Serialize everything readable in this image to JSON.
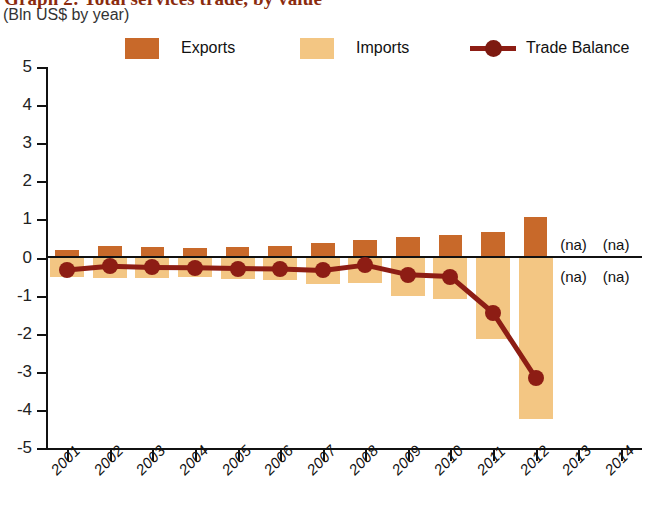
{
  "header": {
    "title": "Graph 2: Total services trade, by value",
    "subtitle": "(Bln US$ by year)"
  },
  "legend": [
    {
      "key": "exports",
      "label": "Exports",
      "color": "#c8692a",
      "marker": "square"
    },
    {
      "key": "imports",
      "label": "Imports",
      "color": "#f3c683",
      "marker": "square"
    },
    {
      "key": "trade_balance",
      "label": "Trade Balance",
      "color": "#8d1d14",
      "marker": "line-dot"
    }
  ],
  "annotations": [
    {
      "text": "(na)",
      "year": "2013",
      "position": "above-zero"
    },
    {
      "text": "(na)",
      "year": "2014",
      "position": "above-zero"
    },
    {
      "text": "(na)",
      "year": "2013",
      "position": "below-zero"
    },
    {
      "text": "(na)",
      "year": "2014",
      "position": "below-zero"
    }
  ],
  "chart_data": {
    "type": "bar",
    "title": "Graph 2: Total services trade, by value",
    "subtitle": "(Bln US$ by year)",
    "xlabel": "",
    "ylabel": "",
    "ylim": [
      -5,
      5
    ],
    "ytick_labels": [
      "5",
      "4",
      "3",
      "2",
      "1",
      "0",
      "-1",
      "-2",
      "-3",
      "-4",
      "-5"
    ],
    "yticks": [
      5,
      4,
      3,
      2,
      1,
      0,
      -1,
      -2,
      -3,
      -4,
      -5
    ],
    "grid": false,
    "legend_position": "top",
    "categories": [
      "2001",
      "2002",
      "2003",
      "2004",
      "2005",
      "2006",
      "2007",
      "2008",
      "2009",
      "2010",
      "2011",
      "2012",
      "2013",
      "2014"
    ],
    "series": [
      {
        "name": "Exports",
        "type": "bar",
        "color": "#c8692a",
        "values": [
          0.2,
          0.3,
          0.27,
          0.24,
          0.27,
          0.31,
          0.38,
          0.47,
          0.55,
          0.6,
          0.68,
          1.07,
          null,
          null
        ]
      },
      {
        "name": "Imports",
        "type": "bar",
        "color": "#f3c683",
        "values": [
          -0.52,
          -0.53,
          -0.54,
          -0.52,
          -0.56,
          -0.6,
          -0.7,
          -0.68,
          -1.0,
          -1.1,
          -2.15,
          -4.23,
          null,
          null
        ]
      },
      {
        "name": "Trade Balance",
        "type": "line",
        "color": "#8d1d14",
        "values": [
          -0.33,
          -0.23,
          -0.26,
          -0.27,
          -0.29,
          -0.3,
          -0.34,
          -0.2,
          -0.45,
          -0.5,
          -1.45,
          -3.15,
          null,
          null
        ]
      }
    ]
  }
}
